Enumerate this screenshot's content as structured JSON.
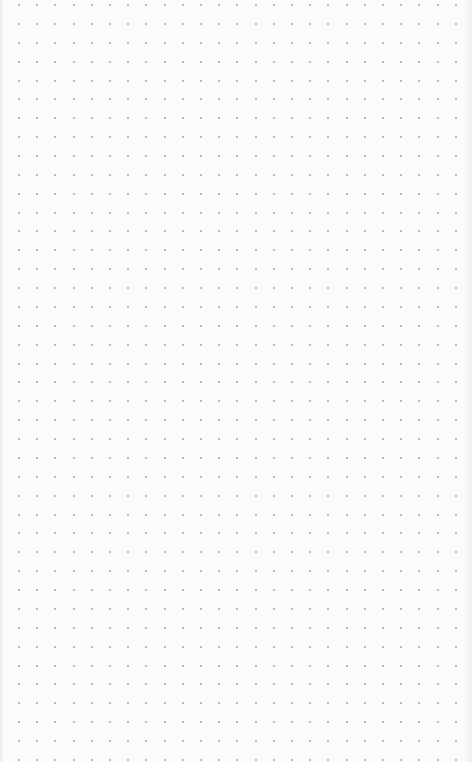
{
  "canvas": {
    "type": "dot-grid",
    "background": "#fbfbfb",
    "dot_color": "#a6a6a6",
    "dot_size": 2,
    "columns": 25,
    "rows": 41,
    "origin_x": 19,
    "origin_y": 5,
    "spacing_x": 18.2,
    "spacing_y": 18.87
  }
}
